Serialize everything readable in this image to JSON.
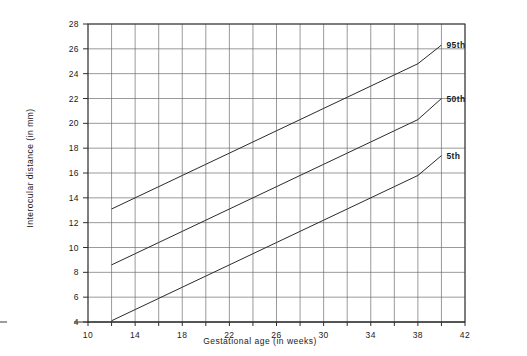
{
  "chart_data": {
    "type": "line",
    "title": "",
    "subtitle": "",
    "xlabel": "Gestational age (in weeks)",
    "ylabel": "Interocular distance (in mm)",
    "xlim": [
      10,
      42
    ],
    "ylim": [
      4,
      28
    ],
    "xticks": [
      10,
      12,
      14,
      16,
      18,
      20,
      22,
      24,
      26,
      28,
      30,
      32,
      34,
      36,
      38,
      40,
      42
    ],
    "xtick_labels": [
      "10",
      "",
      "14",
      "",
      "18",
      "",
      "22",
      "",
      "26",
      "",
      "30",
      "",
      "34",
      "",
      "38",
      "",
      "42"
    ],
    "xtick_labels_major": [
      "10",
      "14",
      "18",
      "22",
      "26",
      "30",
      "34",
      "38",
      "42"
    ],
    "yticks": [
      4,
      6,
      8,
      10,
      12,
      14,
      16,
      18,
      20,
      22,
      24,
      26,
      28
    ],
    "ytick_labels": [
      "4",
      "6",
      "8",
      "10",
      "12",
      "14",
      "16",
      "18",
      "20",
      "22",
      "24",
      "26",
      "28"
    ],
    "grid": true,
    "grid_x_step": 2,
    "grid_y_step": 2,
    "legend_position": "right-inline",
    "x": [
      12,
      14,
      16,
      18,
      20,
      22,
      24,
      26,
      28,
      30,
      32,
      34,
      36,
      38,
      40
    ],
    "series": [
      {
        "name": "95th",
        "label": "95th",
        "color": "#2a2a2a",
        "values": [
          13.1,
          14.0,
          14.9,
          15.8,
          16.7,
          17.6,
          18.5,
          19.4,
          20.3,
          21.2,
          22.1,
          23.0,
          23.9,
          24.8,
          26.3
        ]
      },
      {
        "name": "50th",
        "label": "50th",
        "color": "#2a2a2a",
        "values": [
          8.6,
          9.5,
          10.4,
          11.3,
          12.2,
          13.1,
          14.0,
          14.9,
          15.8,
          16.7,
          17.6,
          18.5,
          19.4,
          20.3,
          22.0
        ]
      },
      {
        "name": "5th",
        "label": "5th",
        "color": "#2a2a2a",
        "values": [
          4.1,
          5.0,
          5.9,
          6.8,
          7.7,
          8.6,
          9.5,
          10.4,
          11.3,
          12.2,
          13.1,
          14.0,
          14.9,
          15.8,
          17.4
        ]
      }
    ]
  },
  "axes": {
    "x_title": "Gestational age (in weeks)",
    "y_title": "Interocular distance (in mm)"
  }
}
